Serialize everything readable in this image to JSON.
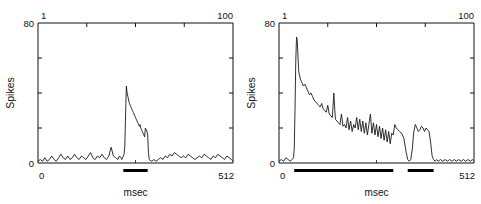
{
  "figure": {
    "panel_count": 2,
    "background_color": "#ffffff",
    "trace_color": "#1a1a1a",
    "bar_color": "#000000"
  },
  "panels": [
    {
      "id": "left",
      "top_axis_left_label": "1",
      "top_axis_right_label": "100",
      "y_axis_label": "Spikes",
      "y_max_label": "80",
      "y_min_label": "0",
      "x_axis_label": "msec",
      "x_min_label": "0",
      "x_max_label": "512"
    },
    {
      "id": "right",
      "top_axis_left_label": "1",
      "top_axis_right_label": "100",
      "y_axis_label": "Spikes",
      "y_max_label": "80",
      "y_min_label": "0",
      "x_axis_label": "msec",
      "x_min_label": "0",
      "x_max_label": "512"
    }
  ],
  "chart_data": [
    {
      "type": "line",
      "panel": "left",
      "title": "",
      "xlabel": "msec",
      "ylabel": "Spikes",
      "xlim": [
        0,
        512
      ],
      "ylim": [
        0,
        80
      ],
      "top_axis": {
        "label": "trial",
        "range": [
          1,
          100
        ],
        "ticks": [
          1,
          25,
          50,
          75,
          100
        ]
      },
      "y_ticks": [
        0,
        20,
        40,
        60,
        80
      ],
      "grid": false,
      "legend": null,
      "stimulus_bars": [
        {
          "start": 224,
          "end": 288
        }
      ],
      "x": [
        0,
        6,
        12,
        18,
        24,
        30,
        36,
        42,
        48,
        54,
        60,
        66,
        72,
        78,
        84,
        90,
        96,
        102,
        108,
        114,
        120,
        126,
        132,
        138,
        144,
        150,
        156,
        162,
        168,
        174,
        180,
        186,
        192,
        198,
        204,
        210,
        214,
        218,
        220,
        222,
        224,
        226,
        228,
        230,
        232,
        234,
        236,
        238,
        240,
        242,
        244,
        246,
        248,
        250,
        252,
        254,
        256,
        258,
        260,
        262,
        264,
        266,
        268,
        270,
        272,
        274,
        276,
        278,
        280,
        282,
        284,
        286,
        288,
        290,
        292,
        298,
        304,
        310,
        316,
        322,
        328,
        334,
        340,
        346,
        352,
        358,
        364,
        370,
        376,
        382,
        388,
        394,
        400,
        406,
        412,
        418,
        424,
        430,
        436,
        442,
        448,
        454,
        460,
        466,
        472,
        478,
        484,
        490,
        496,
        502,
        508,
        512
      ],
      "values": [
        1,
        2,
        1,
        3,
        1,
        2,
        4,
        2,
        1,
        3,
        5,
        3,
        2,
        4,
        2,
        3,
        5,
        3,
        2,
        4,
        3,
        2,
        4,
        6,
        3,
        2,
        4,
        3,
        5,
        3,
        2,
        4,
        9,
        4,
        3,
        2,
        4,
        3,
        2,
        3,
        4,
        5,
        10,
        28,
        44,
        40,
        38,
        36,
        34,
        33,
        32,
        31,
        30,
        29,
        28,
        27,
        26,
        25,
        24,
        23,
        22,
        21,
        22,
        20,
        19,
        18,
        17,
        16,
        15,
        20,
        19,
        18,
        16,
        6,
        2,
        1,
        2,
        1,
        2,
        3,
        2,
        4,
        3,
        5,
        4,
        6,
        5,
        4,
        3,
        4,
        3,
        5,
        4,
        3,
        2,
        3,
        4,
        3,
        5,
        4,
        3,
        2,
        4,
        3,
        5,
        4,
        3,
        2,
        4,
        3,
        2,
        1
      ]
    },
    {
      "type": "line",
      "panel": "right",
      "title": "",
      "xlabel": "msec",
      "ylabel": "Spikes",
      "xlim": [
        0,
        512
      ],
      "ylim": [
        0,
        80
      ],
      "top_axis": {
        "label": "trial",
        "range": [
          1,
          100
        ],
        "ticks": [
          1,
          25,
          50,
          75,
          100
        ]
      },
      "y_ticks": [
        0,
        20,
        40,
        60,
        80
      ],
      "grid": false,
      "legend": null,
      "stimulus_bars": [
        {
          "start": 40,
          "end": 300
        },
        {
          "start": 338,
          "end": 406
        }
      ],
      "x": [
        0,
        6,
        12,
        18,
        24,
        30,
        34,
        38,
        40,
        42,
        44,
        46,
        48,
        50,
        52,
        56,
        60,
        64,
        68,
        72,
        76,
        80,
        84,
        88,
        92,
        96,
        100,
        104,
        108,
        112,
        116,
        120,
        124,
        128,
        132,
        136,
        140,
        144,
        148,
        152,
        156,
        160,
        164,
        168,
        172,
        176,
        180,
        184,
        188,
        192,
        196,
        200,
        204,
        208,
        212,
        216,
        220,
        224,
        228,
        232,
        236,
        240,
        244,
        248,
        252,
        256,
        260,
        264,
        268,
        272,
        276,
        280,
        284,
        288,
        292,
        296,
        300,
        304,
        308,
        312,
        316,
        322,
        328,
        334,
        338,
        342,
        346,
        350,
        354,
        358,
        362,
        366,
        370,
        374,
        378,
        382,
        386,
        390,
        394,
        398,
        402,
        406,
        410,
        414,
        418,
        424,
        430,
        436,
        442,
        448,
        454,
        460,
        466,
        472,
        478,
        484,
        490,
        496,
        502,
        508,
        512
      ],
      "values": [
        1,
        2,
        1,
        3,
        2,
        1,
        2,
        3,
        8,
        30,
        58,
        72,
        70,
        60,
        52,
        48,
        46,
        44,
        45,
        43,
        41,
        39,
        40,
        38,
        36,
        35,
        34,
        33,
        32,
        34,
        31,
        30,
        29,
        33,
        28,
        27,
        26,
        40,
        25,
        24,
        23,
        22,
        28,
        21,
        22,
        20,
        26,
        19,
        24,
        18,
        22,
        20,
        26,
        19,
        25,
        18,
        24,
        17,
        23,
        16,
        22,
        28,
        17,
        23,
        16,
        22,
        15,
        21,
        14,
        20,
        13,
        19,
        12,
        18,
        11,
        17,
        16,
        22,
        20,
        19,
        18,
        17,
        14,
        6,
        2,
        1,
        2,
        8,
        18,
        22,
        20,
        18,
        19,
        21,
        20,
        18,
        20,
        19,
        18,
        12,
        4,
        2,
        1,
        2,
        1,
        2,
        1,
        2,
        1,
        2,
        1,
        2,
        1,
        2,
        1,
        2,
        1,
        2,
        1,
        2,
        1
      ]
    }
  ]
}
